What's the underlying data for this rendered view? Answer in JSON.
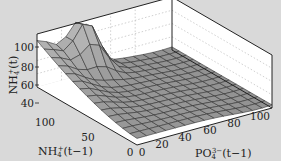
{
  "chart_data": {
    "type": "surface3d",
    "title": "",
    "xlabel": "PO4^3-(t-1)",
    "ylabel": "NH4^+(t-1)",
    "zlabel": "NH4^+(t)",
    "x_ticks": [
      "0",
      "20",
      "40",
      "60",
      "80",
      "100"
    ],
    "y_ticks": [
      "0",
      "50",
      "100"
    ],
    "z_ticks": [
      "40",
      "60",
      "80",
      "100"
    ],
    "xlim": [
      0,
      110
    ],
    "ylim": [
      0,
      110
    ],
    "zlim": [
      40,
      120
    ],
    "grid": true,
    "surface_shape": "plateau ~50 everywhere except a ridge at high NH4+(t-1)/low PO4 rising to ~110 and a peak ~120 near PO4=40, NH4=0 (back edge)",
    "colors": {
      "surface": "#9a9a9a",
      "mesh": "#333333",
      "background": "#d9d9d9",
      "box": "#ffffff"
    }
  },
  "labels": {
    "zlabel_text": "NH",
    "zlabel_sub": "4",
    "zlabel_sup": "+",
    "zlabel_arg": "(t)",
    "ylabel_text": "NH",
    "ylabel_sub": "4",
    "ylabel_sup": "+",
    "ylabel_arg": "(t−1)",
    "xlabel_text": "PO",
    "xlabel_sub": "4",
    "xlabel_sup": "3−",
    "xlabel_arg": "(t−1)"
  },
  "ticks": {
    "z": [
      {
        "v": "100",
        "y": 47
      },
      {
        "v": "80",
        "y": 67
      },
      {
        "v": "60",
        "y": 85
      },
      {
        "v": "40",
        "y": 103
      }
    ],
    "y": [
      {
        "v": "100",
        "x": 45,
        "y": 126
      },
      {
        "v": "50",
        "x": 88,
        "y": 141
      },
      {
        "v": "0",
        "x": 130,
        "y": 156
      }
    ],
    "x": [
      {
        "v": "0",
        "x": 142,
        "y": 156
      },
      {
        "v": "20",
        "x": 162,
        "y": 148
      },
      {
        "v": "40",
        "x": 185,
        "y": 141
      },
      {
        "v": "60",
        "x": 210,
        "y": 134
      },
      {
        "v": "80",
        "x": 234,
        "y": 127
      },
      {
        "v": "100",
        "x": 260,
        "y": 120
      }
    ]
  }
}
